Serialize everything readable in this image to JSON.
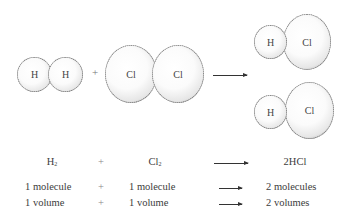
{
  "reaction_diagram": {
    "reactants": [
      {
        "name": "hydrogen-molecule",
        "atoms": [
          "H",
          "H"
        ]
      },
      {
        "name": "chlorine-molecule",
        "atoms": [
          "Cl",
          "Cl"
        ]
      }
    ],
    "operator": "+",
    "products": [
      {
        "name": "hydrogen-chloride-molecule-1",
        "atoms": [
          "H",
          "Cl"
        ]
      },
      {
        "name": "hydrogen-chloride-molecule-2",
        "atoms": [
          "H",
          "Cl"
        ]
      }
    ]
  },
  "equation_table": {
    "rows": [
      {
        "reactant1": "H",
        "reactant1_sub": "2",
        "op": "+",
        "reactant2": "Cl",
        "reactant2_sub": "2",
        "product": "2HCl"
      },
      {
        "reactant1": "1 molecule",
        "op": "+",
        "reactant2": "1 molecule",
        "product": "2 molecules"
      },
      {
        "reactant1": "1 volume",
        "op": "+",
        "reactant2": "1 volume",
        "product": "2 volumes"
      }
    ]
  }
}
